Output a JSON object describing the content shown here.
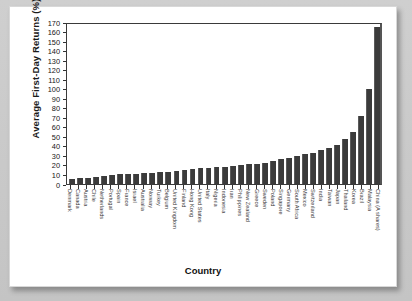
{
  "chart_data": {
    "type": "bar",
    "title": "",
    "xlabel": "Country",
    "ylabel": "Average First-Day Returns (%)",
    "ylim": [
      0,
      170
    ],
    "ytick_step": 10,
    "grid": false,
    "legend": "none",
    "bar_color": "#3b3b3b",
    "yticks": [
      170,
      160,
      150,
      140,
      130,
      120,
      110,
      100,
      90,
      80,
      70,
      60,
      50,
      40,
      30,
      20,
      10,
      0
    ],
    "categories": [
      "Denmark",
      "Canada",
      "Austria",
      "Chile",
      "Netherlands",
      "Portugal",
      "Spain",
      "France",
      "Israel",
      "Australia",
      "Norway",
      "Turkey",
      "Belgium",
      "United Kingdom",
      "Finland",
      "Hong Kong",
      "United States",
      "Italy",
      "Nigeria",
      "Indonesia",
      "Iran",
      "Philippines",
      "New Zealand",
      "Greece",
      "Sweden",
      "Poland",
      "Singapore",
      "Germany",
      "South Africa",
      "Mexico",
      "Switzerland",
      "India",
      "Taiwan",
      "Japan",
      "Thailand",
      "Korea",
      "Brazil",
      "Malaysia",
      "China (A shares)"
    ],
    "values": [
      5,
      6,
      6.5,
      7,
      8,
      9,
      10,
      10.5,
      11,
      11.5,
      12,
      12.5,
      13,
      14,
      15,
      15.5,
      16.5,
      17,
      17.5,
      18,
      19,
      20,
      20.5,
      21.5,
      22,
      24,
      26,
      27,
      29,
      31,
      33,
      36,
      38,
      41,
      47,
      55,
      71,
      100,
      165
    ]
  }
}
